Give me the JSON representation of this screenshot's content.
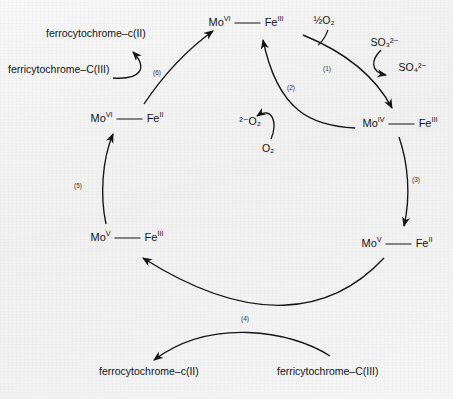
{
  "figure": {
    "background_color": "#f3f3f3",
    "stroke_color": "#141414"
  },
  "nodes": [
    {
      "id": "mo6fe3",
      "mo": "Mo",
      "mo_ox": "VI",
      "fe": "Fe",
      "fe_ox": "III",
      "x": 246,
      "y": 22,
      "role": "oxidized-resting-state"
    },
    {
      "id": "mo4fe3",
      "mo": "Mo",
      "mo_ox": "IV",
      "fe": "Fe",
      "fe_ox": "III",
      "x": 400,
      "y": 123,
      "role": "reduced-molybdenum"
    },
    {
      "id": "mo5fe2",
      "mo": "Mo",
      "mo_ox": "V",
      "fe": "Fe",
      "fe_ox": "II",
      "x": 397,
      "y": 243,
      "role": "intramolecular-transfer-product"
    },
    {
      "id": "mo5fe3",
      "mo": "Mo",
      "mo_ox": "V",
      "fe": "Fe",
      "fe_ox": "III",
      "x": 127,
      "y": 237,
      "role": "one-electron-oxidized"
    },
    {
      "id": "mo6fe2",
      "mo": "Mo",
      "mo_ox": "VI",
      "fe": "Fe",
      "fe_ox": "II",
      "x": 127,
      "y": 118,
      "role": "second-intramolecular-transfer"
    }
  ],
  "substrates": [
    {
      "id": "half-o2",
      "label": "½O₂",
      "x": 324,
      "y": 20,
      "name": "half-oxygen"
    },
    {
      "id": "sulfite",
      "label": "SO₃²⁻",
      "x": 385,
      "y": 42,
      "name": "sulfite"
    },
    {
      "id": "sulfate",
      "label": "SO₄²⁻",
      "x": 413,
      "y": 67,
      "name": "sulfate"
    },
    {
      "id": "superoxide",
      "label": "²⁻O₂",
      "x": 250,
      "y": 121,
      "name": "superoxide"
    },
    {
      "id": "dioxygen",
      "label": "O₂",
      "x": 268,
      "y": 148,
      "name": "dioxygen"
    }
  ],
  "cytochromes": [
    {
      "id": "ferro-top",
      "label": "ferrocytochrome–c(II)",
      "x": 46,
      "y": 33,
      "name": "ferrocytochrome-c-II-top"
    },
    {
      "id": "ferri-top",
      "label": "ferricytochrome–C(III)",
      "x": 8,
      "y": 69,
      "name": "ferricytochrome-C-III-top"
    },
    {
      "id": "ferro-bot",
      "label": "ferrocytochrome–c(II)",
      "x": 99,
      "y": 371,
      "name": "ferrocytochrome-c-II-bottom"
    },
    {
      "id": "ferri-bot",
      "label": "ferricytochrome–C(III)",
      "x": 277,
      "y": 371,
      "name": "ferricytochrome-C-III-bottom"
    }
  ],
  "steps": [
    {
      "id": "s1",
      "label": "(1)",
      "x": 327,
      "y": 69,
      "description": "sulfite oxidation at molybdenum"
    },
    {
      "id": "s2",
      "label": "(2)",
      "x": 291,
      "y": 88,
      "description": "dioxygen to superoxide"
    },
    {
      "id": "s3",
      "label": "(3)",
      "x": 416,
      "y": 180,
      "description": "intramolecular electron transfer Mo to Fe"
    },
    {
      "id": "s4",
      "label": "(4)",
      "x": 245,
      "y": 319,
      "description": "cytochrome c reduction"
    },
    {
      "id": "s5",
      "label": "(5)",
      "x": 78,
      "y": 186,
      "description": "second intramolecular electron transfer"
    },
    {
      "id": "s6",
      "label": "(6)",
      "x": 157,
      "y": 73,
      "description": "second cytochrome c reduction"
    }
  ]
}
